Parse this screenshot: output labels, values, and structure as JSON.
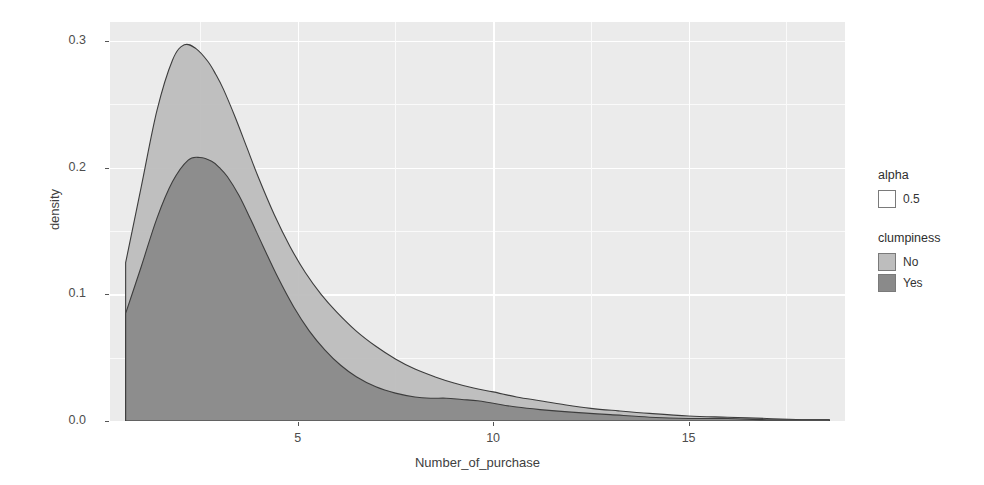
{
  "chart_data": {
    "type": "area",
    "title": "",
    "subtitle": "",
    "xlabel": "Number_of_purchase",
    "ylabel": "density",
    "xlim": [
      0.2,
      19.0
    ],
    "ylim": [
      0.0,
      0.315
    ],
    "x_ticks": [
      5,
      10,
      15
    ],
    "y_ticks": [
      "0.0",
      "0.1",
      "0.2",
      "0.3"
    ],
    "y_tick_values": [
      0.0,
      0.1,
      0.2,
      0.3
    ],
    "grid": true,
    "legend_position": "right",
    "alpha": 0.5,
    "colors": {
      "no_fill": "#bdbdbd",
      "yes_fill": "#8a8a8a",
      "outline": "#3d3d3d",
      "panel_background": "#ebebeb",
      "grid_major": "#ffffff",
      "page_background": "#ffffff"
    },
    "series": [
      {
        "name": "No",
        "fill": "#bdbdbd",
        "x": [
          0.6,
          1.0,
          1.4,
          1.8,
          2.1,
          2.4,
          2.7,
          2.9,
          3.1,
          3.4,
          3.7,
          4.0,
          4.4,
          4.8,
          5.2,
          5.6,
          6.0,
          6.5,
          7.0,
          7.5,
          8.0,
          8.5,
          9.0,
          9.5,
          10.0,
          10.6,
          11.2,
          11.8,
          12.5,
          13.2,
          14.0,
          15.0,
          16.0,
          17.0,
          18.0,
          18.6
        ],
        "y": [
          0.125,
          0.185,
          0.245,
          0.285,
          0.297,
          0.294,
          0.284,
          0.274,
          0.262,
          0.24,
          0.216,
          0.192,
          0.163,
          0.138,
          0.117,
          0.1,
          0.086,
          0.071,
          0.059,
          0.049,
          0.041,
          0.035,
          0.03,
          0.026,
          0.023,
          0.019,
          0.016,
          0.013,
          0.01,
          0.008,
          0.006,
          0.004,
          0.003,
          0.002,
          0.001,
          0.001
        ]
      },
      {
        "name": "Yes",
        "fill": "#8a8a8a",
        "x": [
          0.6,
          1.0,
          1.4,
          1.8,
          2.2,
          2.5,
          2.8,
          3.0,
          3.2,
          3.5,
          3.8,
          4.1,
          4.5,
          4.9,
          5.3,
          5.7,
          6.1,
          6.5,
          7.0,
          7.5,
          8.0,
          8.4,
          8.8,
          9.2,
          9.6,
          10.0,
          10.6,
          11.2,
          12.0,
          13.0,
          14.0,
          15.0,
          16.0,
          17.0,
          18.0,
          18.6
        ],
        "y": [
          0.085,
          0.122,
          0.16,
          0.189,
          0.206,
          0.208,
          0.205,
          0.2,
          0.193,
          0.178,
          0.159,
          0.139,
          0.113,
          0.09,
          0.071,
          0.056,
          0.044,
          0.035,
          0.027,
          0.022,
          0.019,
          0.018,
          0.018,
          0.017,
          0.016,
          0.014,
          0.011,
          0.009,
          0.007,
          0.005,
          0.003,
          0.002,
          0.002,
          0.001,
          0.001,
          0.001
        ]
      }
    ],
    "peaks": [
      {
        "series": "No",
        "x": 2.1,
        "y": 0.297
      },
      {
        "series": "Yes",
        "x": 2.5,
        "y": 0.208
      }
    ]
  },
  "legend": {
    "blocks": [
      {
        "title": "alpha",
        "items": [
          {
            "label": "0.5",
            "swatch": "#ffffff"
          }
        ]
      },
      {
        "title": "clumpiness",
        "items": [
          {
            "label": "No",
            "swatch": "#bdbdbd"
          },
          {
            "label": "Yes",
            "swatch": "#8a8a8a"
          }
        ]
      }
    ]
  },
  "axes": {
    "x_title": "Number_of_purchase",
    "y_title": "density",
    "x_tick_labels": [
      "5",
      "10",
      "15"
    ],
    "y_tick_labels": [
      "0.0",
      "0.1",
      "0.2",
      "0.3"
    ]
  },
  "background_text": {
    "lines": [
      "a strange incident occurred in the crowded room",
      "it happened quickly and the people who stood there went",
      "then the voices turned to murmurs before the noise",
      "and the crowd slowly scattered"
    ]
  }
}
